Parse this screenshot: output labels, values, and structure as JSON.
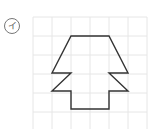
{
  "problem": {
    "label": "イ"
  },
  "grid": {
    "x0": 33,
    "y0": 17,
    "cell": 19,
    "cols": 6,
    "rows": 6,
    "line_color": "#e6e6e6"
  },
  "shape": {
    "stroke": "#333333",
    "points": [
      [
        71,
        36
      ],
      [
        109,
        36
      ],
      [
        128,
        73
      ],
      [
        109,
        73
      ],
      [
        128,
        91
      ],
      [
        109,
        91
      ],
      [
        109,
        109
      ],
      [
        71,
        109
      ],
      [
        71,
        91
      ],
      [
        52,
        91
      ],
      [
        71,
        73
      ],
      [
        52,
        73
      ]
    ]
  }
}
